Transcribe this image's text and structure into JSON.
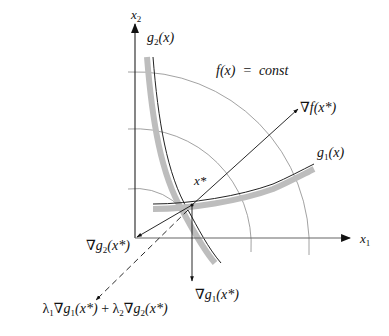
{
  "diagram": {
    "axes": {
      "x_label": "x",
      "x_sub": "1",
      "y_label": "x",
      "y_sub": "2"
    },
    "labels": {
      "f_const": "f(x)  =  const",
      "g1": {
        "base": "g",
        "sub": "1",
        "arg": "(x)"
      },
      "g2": {
        "base": "g",
        "sub": "2",
        "arg": "(x)"
      },
      "xstar": "x*",
      "grad_f": {
        "nabla": "∇",
        "text": "f(x*)"
      },
      "grad_g1": {
        "nabla": "∇",
        "base": "g",
        "sub": "1",
        "arg": "(x*)"
      },
      "grad_g2": {
        "nabla": "∇",
        "base": "g",
        "sub": "2",
        "arg": "(x*)"
      },
      "combo": {
        "l1": "λ",
        "l1_sub": "1",
        "n1": "∇",
        "g1": "g",
        "g1_sub": "1",
        "arg1": "(x*)",
        "plus": " + ",
        "l2": "λ",
        "l2_sub": "2",
        "n2": "∇",
        "g2": "g",
        "g2_sub": "2",
        "arg2": "(x*)"
      }
    },
    "colors": {
      "line": "#222222",
      "arc": "#777777",
      "hatch": "#b5b5b5"
    }
  }
}
